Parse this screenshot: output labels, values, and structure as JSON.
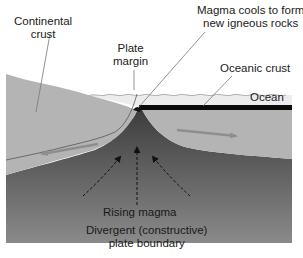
{
  "labels": {
    "continental_crust": [
      "Continental",
      "crust"
    ],
    "plate_margin": [
      "Plate",
      "margin"
    ],
    "magma_cools": [
      "Magma cools to form",
      "new igneous rocks"
    ],
    "oceanic_crust": "Oceanic crust",
    "ocean": "Ocean",
    "rising_magma": "Rising magma",
    "caption": [
      "Divergent (constructive)",
      "plate boundary"
    ]
  },
  "colors": {
    "background": "#ffffff",
    "ocean_water": "#ececec",
    "crust": "#b4b4b4",
    "mantle_top": "#3a3a3a",
    "mantle_bottom": "#8a8a8a",
    "oceanic_crust_band": "#0a0a0a",
    "arrow": "#8e8e8e",
    "leader_line": "#777777"
  },
  "arrows": {
    "plate_motion": [
      "left",
      "right"
    ],
    "magma_flow": [
      "up-left",
      "up",
      "up-right"
    ]
  }
}
